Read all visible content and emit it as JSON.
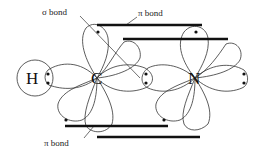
{
  "diagram": {
    "title": "",
    "labels": {
      "sigma": "σ bond",
      "pi_top": "π bond",
      "pi_bottom": "π bond"
    },
    "atoms": {
      "h": "H",
      "c": "C",
      "n": "N"
    },
    "colors": {
      "stroke": "#333333",
      "bond": "#111111",
      "background": "#ffffff"
    }
  }
}
